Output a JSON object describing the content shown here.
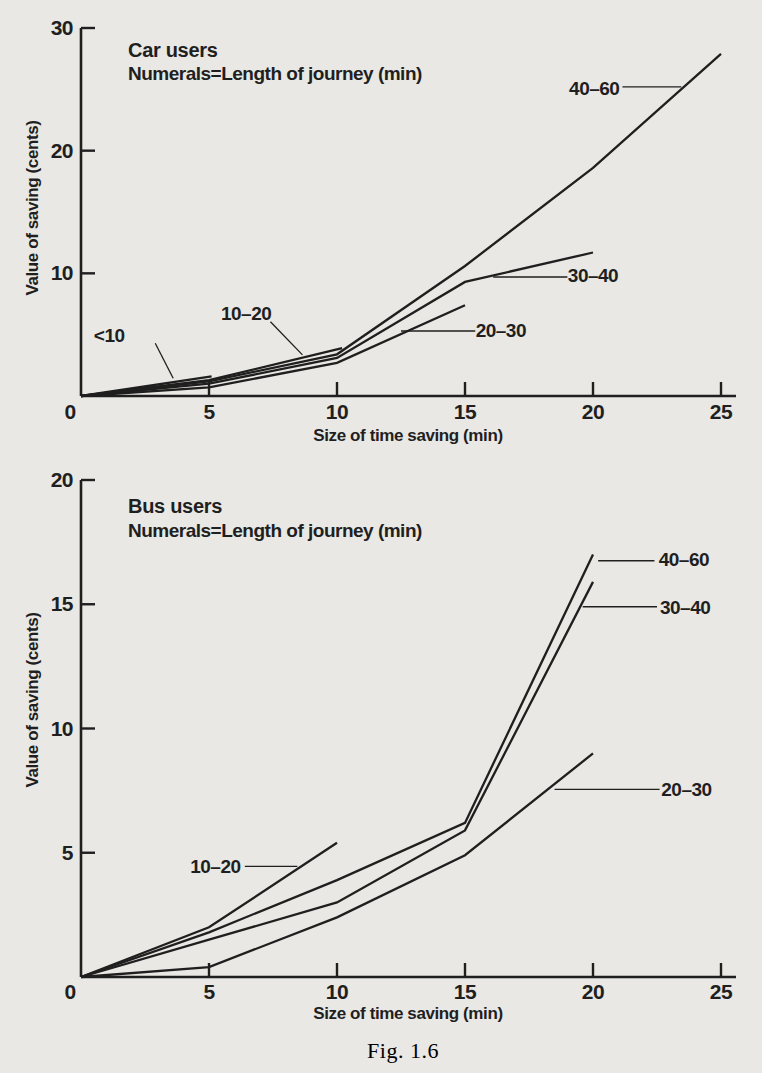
{
  "page": {
    "caption": "Fig. 1.6",
    "background": "#e9e8e4",
    "ink": "#1f1f1f"
  },
  "chart_data": [
    {
      "type": "line",
      "title": "Car users",
      "subtitle": "Numerals=Length of journey (min)",
      "xlabel": "Size of time saving (min)",
      "ylabel": "Value of saving (cents)",
      "xlim": [
        0,
        25
      ],
      "ylim": [
        0,
        30
      ],
      "xticks": [
        0,
        5,
        10,
        15,
        20,
        25
      ],
      "yticks": [
        10,
        20,
        30
      ],
      "grid": false,
      "legend": "none (inline curve labels)",
      "series": [
        {
          "name": "<10",
          "points": [
            [
              0,
              0
            ],
            [
              5.1,
              1.6
            ]
          ]
        },
        {
          "name": "10–20",
          "points": [
            [
              0,
              0
            ],
            [
              5,
              1.3
            ],
            [
              10.2,
              3.9
            ]
          ]
        },
        {
          "name": "20–30",
          "points": [
            [
              0,
              0
            ],
            [
              5,
              0.7
            ],
            [
              10,
              2.7
            ],
            [
              15,
              7.4
            ]
          ]
        },
        {
          "name": "30–40",
          "points": [
            [
              0,
              0
            ],
            [
              5,
              1.0
            ],
            [
              10,
              3.1
            ],
            [
              15,
              9.3
            ],
            [
              20,
              11.7
            ]
          ]
        },
        {
          "name": "40–60",
          "points": [
            [
              0,
              0
            ],
            [
              5,
              1.2
            ],
            [
              10,
              3.4
            ],
            [
              15,
              10.6
            ],
            [
              20,
              18.6
            ],
            [
              25,
              27.9
            ]
          ]
        }
      ],
      "annotations": [
        {
          "text": "<10",
          "x": 1.1,
          "y": 4.9,
          "leader": [
            [
              2.9,
              4.3
            ],
            [
              3.6,
              1.45
            ]
          ]
        },
        {
          "text": "10–20",
          "x": 6.45,
          "y": 6.75,
          "leader": [
            [
              7.4,
              6.05
            ],
            [
              8.65,
              3.35
            ]
          ]
        },
        {
          "text": "20–30",
          "x": 16.4,
          "y": 5.35,
          "leader": [
            [
              12.5,
              5.3
            ],
            [
              15.4,
              5.3
            ]
          ]
        },
        {
          "text": "30–40",
          "x": 20.0,
          "y": 9.8,
          "leader": [
            [
              16.1,
              9.7
            ],
            [
              19.0,
              9.7
            ]
          ]
        },
        {
          "text": "40–60",
          "x": 20.05,
          "y": 25.1,
          "leader": [
            [
              21.15,
              25.2
            ],
            [
              23.45,
              25.2
            ]
          ]
        }
      ]
    },
    {
      "type": "line",
      "title": "Bus users",
      "subtitle": "Numerals=Length of journey (min)",
      "xlabel": "Size of time saving (min)",
      "ylabel": "Value of saving (cents)",
      "xlim": [
        0,
        25
      ],
      "ylim": [
        0,
        20
      ],
      "xticks": [
        0,
        5,
        10,
        15,
        20,
        25
      ],
      "yticks": [
        5,
        10,
        15,
        20
      ],
      "grid": false,
      "legend": "none (inline curve labels)",
      "series": [
        {
          "name": "10–20",
          "points": [
            [
              0,
              0
            ],
            [
              5,
              2.0
            ],
            [
              10,
              5.4
            ]
          ]
        },
        {
          "name": "20–30",
          "points": [
            [
              0,
              0
            ],
            [
              5,
              0.4
            ],
            [
              10,
              2.4
            ],
            [
              15,
              4.9
            ],
            [
              20,
              9.0
            ]
          ]
        },
        {
          "name": "30–40",
          "points": [
            [
              0,
              0
            ],
            [
              5,
              1.5
            ],
            [
              10,
              3.0
            ],
            [
              15,
              5.9
            ],
            [
              20,
              15.9
            ]
          ]
        },
        {
          "name": "40–60",
          "points": [
            [
              0,
              0
            ],
            [
              5,
              1.8
            ],
            [
              10,
              3.9
            ],
            [
              15,
              6.2
            ],
            [
              20,
              17.0
            ]
          ]
        }
      ],
      "annotations": [
        {
          "text": "10–20",
          "x": 5.25,
          "y": 4.45,
          "leader": [
            [
              6.4,
              4.45
            ],
            [
              8.45,
              4.45
            ]
          ]
        },
        {
          "text": "20–30",
          "x": 23.65,
          "y": 7.55,
          "leader": [
            [
              18.5,
              7.55
            ],
            [
              22.6,
              7.55
            ]
          ]
        },
        {
          "text": "30–40",
          "x": 23.6,
          "y": 14.85,
          "leader": [
            [
              19.6,
              14.9
            ],
            [
              22.5,
              14.9
            ]
          ]
        },
        {
          "text": "40–60",
          "x": 23.55,
          "y": 16.8,
          "leader": [
            [
              20.2,
              16.75
            ],
            [
              22.4,
              16.75
            ]
          ]
        }
      ]
    }
  ]
}
